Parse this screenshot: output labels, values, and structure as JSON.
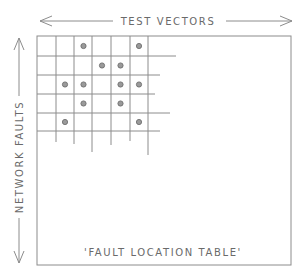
{
  "diagram": {
    "title_top": "TEST VECTORS",
    "title_left": "NETWORK FAULTS",
    "caption": "'FAULT LOCATION TABLE'",
    "colors": {
      "line": "#8c8c8c",
      "text": "#6a6a6a",
      "dot_fill": "#9a9a9a",
      "dot_stroke": "#6e6e6e",
      "background": "#ffffff"
    },
    "grid": {
      "columns": 6,
      "rows": 5,
      "marked_cells": [
        {
          "row": 0,
          "col": 2
        },
        {
          "row": 0,
          "col": 5
        },
        {
          "row": 1,
          "col": 3
        },
        {
          "row": 1,
          "col": 4
        },
        {
          "row": 2,
          "col": 1
        },
        {
          "row": 2,
          "col": 2
        },
        {
          "row": 2,
          "col": 4
        },
        {
          "row": 2,
          "col": 5
        },
        {
          "row": 3,
          "col": 2
        },
        {
          "row": 3,
          "col": 4
        },
        {
          "row": 4,
          "col": 1
        },
        {
          "row": 4,
          "col": 5
        }
      ]
    }
  }
}
